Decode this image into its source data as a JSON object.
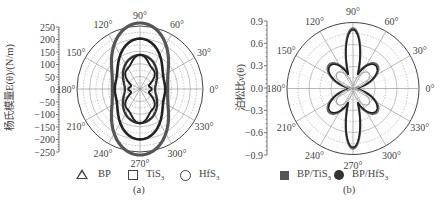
{
  "chart_data": [
    {
      "type": "polar-line",
      "panel": "(a)",
      "ylabel": "杨氏模量E(θ)/(N/m)",
      "radial_axis": {
        "ticks": [
          250,
          200,
          150,
          100,
          50,
          0,
          -50,
          -100,
          -150,
          -200,
          -250
        ],
        "range": [
          0,
          250
        ]
      },
      "angle_labels": [
        "0°",
        "30°",
        "60°",
        "90°",
        "120°",
        "150°",
        "180°",
        "210°",
        "240°",
        "270°",
        "300°",
        "330°"
      ],
      "legend": [
        {
          "name": "BP",
          "marker": "open-triangle"
        },
        {
          "name": "TiS3",
          "marker": "open-square"
        },
        {
          "name": "HfS3",
          "marker": "open-circle"
        }
      ],
      "series": [
        {
          "name": "HfS3",
          "color": "#555555",
          "width": 3.2,
          "E_0": 110,
          "E_90": 262,
          "E_45": 160
        },
        {
          "name": "TiS3",
          "color": "#222222",
          "width": 2.6,
          "E_0": 100,
          "E_90": 200,
          "E_45": 125
        },
        {
          "name": "BP (outer)",
          "color": "#333333",
          "width": 2.4,
          "E_0": 60,
          "E_90": 135,
          "E_45": 95
        },
        {
          "name": "BP",
          "color": "#222222",
          "width": 2.0,
          "E_0": 38,
          "E_90": 128,
          "E_45": 75
        }
      ]
    },
    {
      "type": "polar-line",
      "panel": "(b)",
      "ylabel": "泊松比ν(θ)",
      "radial_axis": {
        "ticks": [
          0.9,
          0.6,
          0.3,
          0.0,
          -0.3,
          -0.6,
          -0.9
        ],
        "range": [
          0,
          0.9
        ]
      },
      "angle_labels": [
        "0°",
        "30°",
        "60°",
        "90°",
        "120°",
        "150°",
        "180°",
        "210°",
        "240°",
        "270°",
        "300°",
        "330°"
      ],
      "legend": [
        {
          "name": "BP/TiS3",
          "marker": "filled-square"
        },
        {
          "name": "BP/HfS3",
          "marker": "filled-circle"
        }
      ],
      "series": [
        {
          "name": "BP/TiS3",
          "color": "#666666",
          "width": 2.2,
          "v_0": 0.05,
          "v_90": 0.82,
          "v_45": 0.46
        },
        {
          "name": "BP/HfS3",
          "color": "#222222",
          "width": 1.6,
          "v_0": 0.08,
          "v_90": 0.8,
          "v_45": 0.44
        },
        {
          "name": "inner",
          "color": "#aaaaaa",
          "width": 1.2,
          "v_0": 0.02,
          "v_90": 0.05,
          "v_45": 0.3
        }
      ]
    }
  ],
  "panel_a": {
    "ylabel": "杨氏模量E(θ)/(N/m)",
    "caption": "(a)",
    "yticks": [
      "250",
      "200",
      "150",
      "100",
      "50",
      "0",
      "−50",
      "−100",
      "−150",
      "−200",
      "−250"
    ],
    "legend": {
      "bp": "BP",
      "tis3_main": "TiS",
      "tis3_sub": "3",
      "hfs3_main": "HfS",
      "hfs3_sub": "3"
    }
  },
  "panel_b": {
    "ylabel": "泊松比ν(θ)",
    "caption": "(b)",
    "yticks": [
      "0.9",
      "0.6",
      "0.3",
      "0.0",
      "−0.3",
      "−0.6",
      "−0.9"
    ],
    "legend": {
      "tis3_main": "BP/TiS",
      "tis3_sub": "3",
      "hfs3_main": "BP/HfS",
      "hfs3_sub": "3"
    }
  },
  "angle_labels": [
    "0°",
    "30°",
    "60°",
    "90°",
    "120°",
    "150°",
    "180°",
    "210°",
    "240°",
    "270°",
    "300°",
    "330°"
  ]
}
